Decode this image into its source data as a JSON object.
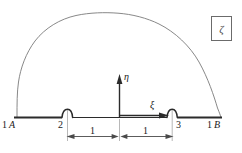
{
  "figure": {
    "title_symbol": "ζ",
    "domain_outline": {
      "baseline_label_left": "1",
      "baseline_label_right": "1"
    },
    "nodes": [
      {
        "id": "n1A",
        "number": "1",
        "letter": "A",
        "x": 16,
        "y": 118
      },
      {
        "id": "n2",
        "number": "2",
        "letter": "",
        "x": 67,
        "y": 118
      },
      {
        "id": "n3",
        "number": "3",
        "letter": "",
        "x": 172,
        "y": 118
      },
      {
        "id": "n1B",
        "number": "1",
        "letter": "B",
        "x": 221,
        "y": 118
      }
    ],
    "node_labels": {
      "left_end": "1",
      "left_end_letter": "A",
      "left_bump": "2",
      "right_bump": "3",
      "right_end": "1",
      "right_end_letter": "B"
    },
    "axes": {
      "vertical": {
        "symbol": "η",
        "name": "eta",
        "direction": "up"
      },
      "horizontal": {
        "symbol": "ξ",
        "name": "xi",
        "direction": "right"
      },
      "out_of_plane": {
        "symbol": "ζ",
        "name": "zeta"
      }
    },
    "dimensions": [
      {
        "label": "1",
        "span": "left-segment"
      },
      {
        "label": "1",
        "span": "right-segment"
      }
    ],
    "colors": {
      "outline": "#7a7a7a",
      "baseline": "#2b2b2b",
      "axis": "#2b2b2b",
      "dimension": "#4a4a4a",
      "extension": "#9a9a9a",
      "box_border": "#6b6b6b",
      "text": "#1a1a1a",
      "background": "#ffffff"
    }
  }
}
